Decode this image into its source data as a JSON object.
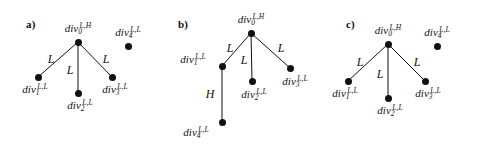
{
  "figure": {
    "background_color": "#ffffff",
    "ink_color": "#111111",
    "panels": [
      {
        "id": "a",
        "letter": "a)",
        "letter_pos": {
          "x": 26,
          "y": 19
        },
        "nodes": [
          {
            "id": "div0",
            "name": "div",
            "sub": "0",
            "sup": "L,H",
            "x": 78,
            "y": 42,
            "label_x": 78,
            "label_y": 29
          },
          {
            "id": "div1",
            "name": "div",
            "sub": "1",
            "sup": "L,L",
            "x": 38,
            "y": 77,
            "label_x": 35,
            "label_y": 90
          },
          {
            "id": "div2",
            "name": "div",
            "sub": "2",
            "sup": "L,L",
            "x": 78,
            "y": 93,
            "label_x": 80,
            "label_y": 106
          },
          {
            "id": "div3",
            "name": "div",
            "sub": "3",
            "sup": "L,L",
            "x": 112,
            "y": 77,
            "label_x": 115,
            "label_y": 90
          },
          {
            "id": "div4",
            "name": "div",
            "sub": "4",
            "sup": "L,L",
            "x": 128,
            "y": 46,
            "label_x": 128,
            "label_y": 33
          }
        ],
        "edges": [
          {
            "from": "div0",
            "to": "div1",
            "label": "L",
            "label_x": 51,
            "label_y": 59
          },
          {
            "from": "div0",
            "to": "div2",
            "label": "L",
            "label_x": 70,
            "label_y": 70
          },
          {
            "from": "div0",
            "to": "div3",
            "label": "L",
            "label_x": 106,
            "label_y": 59
          }
        ]
      },
      {
        "id": "b",
        "letter": "b)",
        "letter_pos": {
          "x": 22,
          "y": 19
        },
        "nodes": [
          {
            "id": "div0",
            "name": "div",
            "sub": "0",
            "sup": "L,H",
            "x": 95,
            "y": 33,
            "label_x": 95,
            "label_y": 20
          },
          {
            "id": "div1",
            "name": "div",
            "sub": "1",
            "sup": "L,L",
            "x": 66,
            "y": 66,
            "label_x": 37,
            "label_y": 60
          },
          {
            "id": "div2",
            "name": "div",
            "sub": "2",
            "sup": "L,L",
            "x": 96,
            "y": 81,
            "label_x": 98,
            "label_y": 95
          },
          {
            "id": "div3",
            "name": "div",
            "sub": "3",
            "sup": "L,L",
            "x": 134,
            "y": 68,
            "label_x": 139,
            "label_y": 82
          },
          {
            "id": "div4",
            "name": "div",
            "sub": "4",
            "sup": "L,L",
            "x": 66,
            "y": 122,
            "label_x": 40,
            "label_y": 133
          }
        ],
        "edges": [
          {
            "from": "div0",
            "to": "div1",
            "label": "L",
            "label_x": 74,
            "label_y": 48
          },
          {
            "from": "div0",
            "to": "div2",
            "label": "L",
            "label_x": 88,
            "label_y": 60
          },
          {
            "from": "div0",
            "to": "div3",
            "label": "L",
            "label_x": 125,
            "label_y": 48
          },
          {
            "from": "div1",
            "to": "div4",
            "label": "H",
            "label_x": 54,
            "label_y": 94
          }
        ]
      },
      {
        "id": "c",
        "letter": "c)",
        "letter_pos": {
          "x": 34,
          "y": 19
        },
        "nodes": [
          {
            "id": "div0",
            "name": "div",
            "sub": "0",
            "sup": "L,H",
            "x": 76,
            "y": 44,
            "label_x": 76,
            "label_y": 31
          },
          {
            "id": "div1",
            "name": "div",
            "sub": "1",
            "sup": "L,L",
            "x": 36,
            "y": 81,
            "label_x": 33,
            "label_y": 94
          },
          {
            "id": "div2",
            "name": "div",
            "sub": "2",
            "sup": "L,L",
            "x": 76,
            "y": 98,
            "label_x": 78,
            "label_y": 111
          },
          {
            "id": "div3",
            "name": "div",
            "sub": "3",
            "sup": "L,L",
            "x": 113,
            "y": 81,
            "label_x": 116,
            "label_y": 94
          },
          {
            "id": "div4",
            "name": "div",
            "sub": "4",
            "sup": "L,L",
            "x": 125,
            "y": 46,
            "label_x": 125,
            "label_y": 33
          }
        ],
        "edges": [
          {
            "from": "div0",
            "to": "div1",
            "label": "L",
            "label_x": 48,
            "label_y": 62
          },
          {
            "from": "div0",
            "to": "div2",
            "label": "L",
            "label_x": 68,
            "label_y": 74
          },
          {
            "from": "div0",
            "to": "div3",
            "label": "L",
            "label_x": 105,
            "label_y": 62
          }
        ]
      }
    ]
  }
}
